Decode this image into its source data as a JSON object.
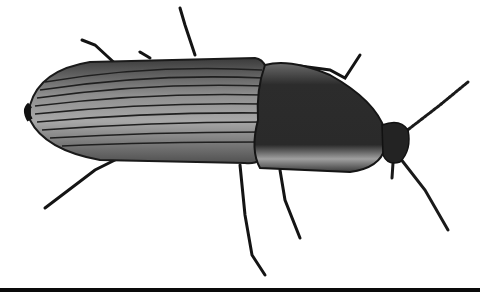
{
  "image": {
    "subject": "click beetle",
    "view": "dorsal, facing right",
    "background": "#ffffff",
    "colors": {
      "body_dark": "#2a2a2a",
      "highlight": "#9a9a9a",
      "stripe": "#1a1a1a",
      "baseline": "#0a0a0a"
    }
  }
}
